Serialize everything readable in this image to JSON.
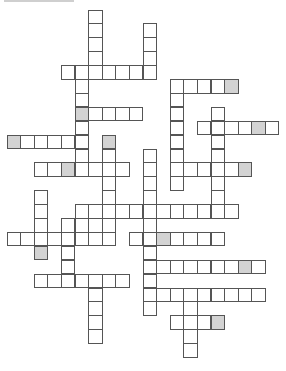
{
  "puzzle": {
    "type": "crossword",
    "header_text_visible": false,
    "grid": {
      "cell_pitch_x": 13.6,
      "cell_pitch_y": 13.9,
      "origin_x": 6.5,
      "origin_y": 9.5,
      "cell_size": 14.5,
      "colors": {
        "border": "#555555",
        "empty": "#ffffff",
        "shaded": "#d3d3d3"
      }
    },
    "words": [
      {
        "dir": "down",
        "col": 6,
        "row": 0,
        "len": 5
      },
      {
        "dir": "down",
        "col": 10,
        "row": 1,
        "len": 4
      },
      {
        "dir": "across",
        "col": 4,
        "row": 4,
        "len": 7
      },
      {
        "dir": "down",
        "col": 5,
        "row": 4,
        "len": 8
      },
      {
        "dir": "across",
        "col": 5,
        "row": 7,
        "len": 5,
        "shaded": [
          0
        ]
      },
      {
        "dir": "across",
        "col": 0,
        "row": 9,
        "len": 6,
        "shaded": [
          0
        ]
      },
      {
        "dir": "down",
        "col": 7,
        "row": 9,
        "len": 8,
        "shaded": [
          0
        ]
      },
      {
        "dir": "across",
        "col": 2,
        "row": 11,
        "len": 7,
        "shaded": [
          2
        ]
      },
      {
        "dir": "across",
        "col": 12,
        "row": 5,
        "len": 5,
        "shaded": [
          4
        ]
      },
      {
        "dir": "down",
        "col": 12,
        "row": 5,
        "len": 8
      },
      {
        "dir": "down",
        "col": 15,
        "row": 7,
        "len": 8
      },
      {
        "dir": "across",
        "col": 14,
        "row": 8,
        "len": 6,
        "shaded": [
          4
        ]
      },
      {
        "dir": "across",
        "col": 12,
        "row": 11,
        "len": 6,
        "shaded": [
          5
        ]
      },
      {
        "dir": "down",
        "col": 10,
        "row": 10,
        "len": 12
      },
      {
        "dir": "down",
        "col": 2,
        "row": 13,
        "len": 5,
        "shaded": [
          4
        ]
      },
      {
        "dir": "across",
        "col": 5,
        "row": 14,
        "len": 12
      },
      {
        "dir": "across",
        "col": 4,
        "row": 15,
        "len": 4
      },
      {
        "dir": "across",
        "col": 0,
        "row": 16,
        "len": 8
      },
      {
        "dir": "across",
        "col": 9,
        "row": 16,
        "len": 7,
        "shaded": [
          2
        ]
      },
      {
        "dir": "down",
        "col": 4,
        "row": 15,
        "len": 5
      },
      {
        "dir": "across",
        "col": 10,
        "row": 18,
        "len": 9,
        "shaded": [
          7
        ]
      },
      {
        "dir": "across",
        "col": 2,
        "row": 19,
        "len": 7
      },
      {
        "dir": "down",
        "col": 6,
        "row": 19,
        "len": 5
      },
      {
        "dir": "across",
        "col": 10,
        "row": 20,
        "len": 9
      },
      {
        "dir": "down",
        "col": 13,
        "row": 20,
        "len": 5
      },
      {
        "dir": "across",
        "col": 12,
        "row": 22,
        "len": 4,
        "shaded": [
          3
        ]
      }
    ]
  }
}
